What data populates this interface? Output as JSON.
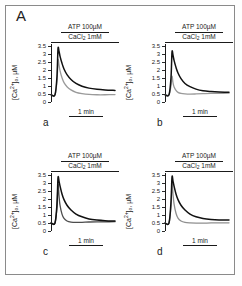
{
  "figure": {
    "major_label": "A",
    "axis": {
      "y_label_prefix": "[Ca",
      "y_label_sup": "2+",
      "y_label_mid": "]",
      "y_label_sub": "o",
      "y_label_suffix": ", µM",
      "y_label_full": "[Ca2+]o, µM",
      "ticks": [
        "3.5",
        "3",
        "2.5",
        "2",
        "1.5",
        "1",
        "0.5",
        "0"
      ],
      "tick_values": [
        3.5,
        3,
        2.5,
        2,
        1.5,
        1,
        0.5,
        0
      ],
      "ylim": [
        0,
        3.6
      ],
      "x_scalebar_label": "1 min"
    },
    "stimulus": {
      "atp": "ATP 100µM",
      "cacl2_prefix": "CaCl",
      "cacl2_sub": "2",
      "cacl2_suffix": " 1mM",
      "cacl2_full": "CaCl2 1mM"
    },
    "colors": {
      "trace_primary": "#111111",
      "trace_secondary": "#9a9a9a",
      "trace_secondary_dark": "#4d4d4d",
      "axis": "#1a1a1a",
      "frame": "#8a8a8a",
      "background": "#ffffff"
    }
  },
  "chart_data": [
    {
      "type": "line",
      "panel": "a",
      "title": "",
      "xlabel": "time",
      "ylabel": "[Ca2+]o, µM",
      "ylim": [
        0,
        3.6
      ],
      "xlim": [
        0,
        64
      ],
      "grid": false,
      "legend": "none",
      "annotations": [
        "ATP 100µM",
        "CaCl2 1mM",
        "1 min"
      ],
      "series": [
        {
          "name": "black trace",
          "color": "#111111",
          "peak": 3.3,
          "baseline_start": 0.45,
          "plateau": 0.72,
          "x": [
            0,
            4,
            6,
            7,
            8,
            9,
            11,
            13,
            16,
            20,
            25,
            31,
            38,
            46,
            54,
            64
          ],
          "values": [
            0.45,
            0.45,
            1.6,
            3.3,
            3.15,
            2.85,
            2.4,
            2.05,
            1.7,
            1.4,
            1.15,
            0.98,
            0.86,
            0.79,
            0.75,
            0.72
          ]
        },
        {
          "name": "gray trace",
          "color": "#9a9a9a",
          "peak": 2.6,
          "baseline_start": 0.45,
          "plateau": 0.45,
          "x": [
            0,
            4,
            6,
            7,
            8,
            9,
            11,
            13,
            16,
            20,
            25,
            31,
            38,
            46,
            54,
            64
          ],
          "values": [
            0.45,
            0.45,
            1.3,
            2.6,
            2.3,
            1.95,
            1.5,
            1.2,
            0.95,
            0.75,
            0.6,
            0.52,
            0.47,
            0.45,
            0.45,
            0.46
          ]
        }
      ]
    },
    {
      "type": "line",
      "panel": "b",
      "title": "",
      "xlabel": "time",
      "ylabel": "[Ca2+]o, µM",
      "ylim": [
        0,
        3.6
      ],
      "xlim": [
        0,
        64
      ],
      "grid": false,
      "legend": "none",
      "annotations": [
        "ATP 100µM",
        "CaCl2 1mM",
        "1 min"
      ],
      "series": [
        {
          "name": "black trace",
          "color": "#111111",
          "peak": 3.1,
          "baseline_start": 0.45,
          "plateau": 0.6,
          "x": [
            0,
            4,
            6,
            7,
            8,
            9,
            11,
            13,
            16,
            20,
            25,
            31,
            38,
            46,
            54,
            64
          ],
          "values": [
            0.45,
            0.45,
            1.5,
            3.1,
            2.9,
            2.6,
            2.15,
            1.8,
            1.45,
            1.15,
            0.95,
            0.8,
            0.7,
            0.65,
            0.62,
            0.6
          ]
        },
        {
          "name": "gray trace",
          "color": "#9a9a9a",
          "peak": 1.6,
          "baseline_start": 0.45,
          "plateau": 0.5,
          "x": [
            0,
            4,
            6,
            7,
            8,
            9,
            11,
            13,
            16,
            20,
            25,
            31,
            38,
            46,
            54,
            64
          ],
          "values": [
            0.45,
            0.45,
            1.0,
            1.6,
            1.2,
            0.95,
            0.72,
            0.6,
            0.53,
            0.5,
            0.49,
            0.5,
            0.52,
            0.54,
            0.54,
            0.55
          ]
        }
      ]
    },
    {
      "type": "line",
      "panel": "c",
      "title": "",
      "xlabel": "time",
      "ylabel": "[Ca2+]o, µM",
      "ylim": [
        0,
        3.6
      ],
      "xlim": [
        0,
        64
      ],
      "grid": false,
      "legend": "none",
      "annotations": [
        "ATP 100µM",
        "CaCl2 1mM",
        "1 min"
      ],
      "series": [
        {
          "name": "black trace",
          "color": "#111111",
          "peak": 3.3,
          "baseline_start": 0.5,
          "plateau": 0.62,
          "x": [
            0,
            4,
            6,
            7,
            8,
            9,
            11,
            13,
            16,
            20,
            25,
            31,
            38,
            46,
            54,
            64
          ],
          "values": [
            0.5,
            0.5,
            1.7,
            3.3,
            3.1,
            2.8,
            2.3,
            1.95,
            1.6,
            1.3,
            1.05,
            0.88,
            0.75,
            0.68,
            0.64,
            0.62
          ]
        },
        {
          "name": "dark gray trace",
          "color": "#4d4d4d",
          "peak": 2.9,
          "baseline_start": 0.5,
          "plateau": 0.55,
          "x": [
            0,
            4,
            6,
            7,
            8,
            9,
            11,
            13,
            16,
            20,
            25,
            31,
            38,
            46,
            54,
            64
          ],
          "values": [
            0.5,
            0.5,
            1.5,
            2.9,
            2.2,
            1.6,
            1.05,
            0.78,
            0.62,
            0.55,
            0.53,
            0.54,
            0.56,
            0.57,
            0.57,
            0.58
          ]
        }
      ]
    },
    {
      "type": "line",
      "panel": "d",
      "title": "",
      "xlabel": "time",
      "ylabel": "[Ca2+]o, µM",
      "ylim": [
        0,
        3.6
      ],
      "xlim": [
        0,
        64
      ],
      "grid": false,
      "legend": "none",
      "annotations": [
        "ATP 100µM",
        "CaCl2 1mM",
        "1 min"
      ],
      "series": [
        {
          "name": "black trace",
          "color": "#111111",
          "peak": 3.35,
          "baseline_start": 0.5,
          "plateau": 0.68,
          "x": [
            0,
            4,
            6,
            7,
            8,
            9,
            11,
            13,
            16,
            20,
            25,
            31,
            38,
            46,
            54,
            64
          ],
          "values": [
            0.5,
            0.5,
            1.8,
            3.35,
            3.1,
            2.8,
            2.3,
            1.95,
            1.6,
            1.3,
            1.05,
            0.88,
            0.78,
            0.72,
            0.69,
            0.68
          ]
        },
        {
          "name": "gray trace",
          "color": "#8f8f8f",
          "peak": 3.0,
          "baseline_start": 0.5,
          "plateau": 0.5,
          "x": [
            0,
            4,
            6,
            7,
            8,
            9,
            11,
            13,
            16,
            20,
            25,
            31,
            38,
            46,
            54,
            64
          ],
          "values": [
            0.5,
            0.5,
            1.6,
            3.0,
            2.3,
            1.7,
            1.1,
            0.8,
            0.62,
            0.53,
            0.5,
            0.49,
            0.49,
            0.5,
            0.5,
            0.51
          ]
        }
      ]
    }
  ],
  "panels": [
    {
      "letter": "a"
    },
    {
      "letter": "b"
    },
    {
      "letter": "c"
    },
    {
      "letter": "d"
    }
  ]
}
